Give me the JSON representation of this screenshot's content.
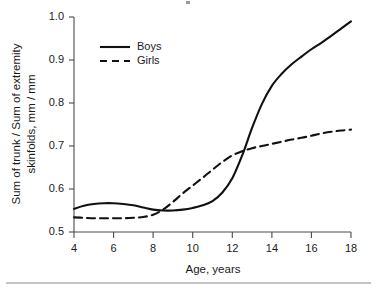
{
  "chart_data": {
    "type": "line",
    "title": "",
    "xlabel": "Age, years",
    "ylabel": "Sum of trunk / Sum of extremity skinfolds,  mm / mm",
    "ylabel_line1": "Sum of trunk / Sum of extremity",
    "ylabel_line2": "skinfolds,  mm / mm",
    "xlim": [
      4,
      18
    ],
    "ylim": [
      0.5,
      1.0
    ],
    "xticks": [
      4,
      6,
      8,
      10,
      12,
      14,
      16,
      18
    ],
    "xtick_labels": [
      "4",
      "6",
      "8",
      "10",
      "12",
      "14",
      "16",
      "18"
    ],
    "yticks": [
      0.5,
      0.6,
      0.7,
      0.8,
      0.9,
      1.0
    ],
    "ytick_labels": [
      "0.5",
      "0.6",
      "0.7",
      "0.8",
      "0.9",
      "1.0"
    ],
    "grid": false,
    "legend_position": "upper-left-inside",
    "series": [
      {
        "name": "Boys",
        "style": "solid",
        "color": "#111111",
        "x": [
          4,
          4.5,
          5,
          5.5,
          6,
          6.5,
          7,
          7.5,
          8,
          8.5,
          9,
          9.5,
          10,
          10.5,
          11,
          11.5,
          12,
          12.5,
          13,
          13.5,
          14,
          14.5,
          15,
          15.5,
          16,
          16.5,
          17,
          17.5,
          18
        ],
        "values": [
          0.554,
          0.561,
          0.565,
          0.567,
          0.567,
          0.565,
          0.562,
          0.557,
          0.552,
          0.55,
          0.55,
          0.552,
          0.556,
          0.562,
          0.572,
          0.592,
          0.625,
          0.678,
          0.742,
          0.798,
          0.84,
          0.868,
          0.89,
          0.908,
          0.925,
          0.94,
          0.956,
          0.973,
          0.99
        ]
      },
      {
        "name": "Girls",
        "style": "dashed",
        "color": "#111111",
        "x": [
          4,
          4.5,
          5,
          5.5,
          6,
          6.5,
          7,
          7.5,
          8,
          8.5,
          9,
          9.5,
          10,
          10.5,
          11,
          11.5,
          12,
          12.5,
          13,
          13.5,
          14,
          14.5,
          15,
          15.5,
          16,
          16.5,
          17,
          17.5,
          18
        ],
        "values": [
          0.534,
          0.533,
          0.532,
          0.532,
          0.532,
          0.532,
          0.533,
          0.535,
          0.54,
          0.552,
          0.57,
          0.59,
          0.608,
          0.626,
          0.645,
          0.663,
          0.678,
          0.688,
          0.695,
          0.7,
          0.705,
          0.71,
          0.715,
          0.719,
          0.724,
          0.729,
          0.733,
          0.736,
          0.738
        ]
      }
    ],
    "annotations": {
      "crossover_age": 12.35,
      "crossover_value": 0.686
    }
  },
  "legend": {
    "items": [
      {
        "label": "Boys",
        "style": "solid"
      },
      {
        "label": "Girls",
        "style": "dashed"
      }
    ]
  }
}
